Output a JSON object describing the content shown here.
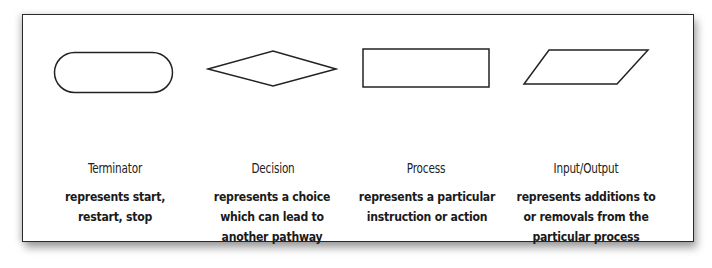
{
  "diagram": {
    "shapes": [
      {
        "id": "terminator",
        "shape": "rounded-rectangle",
        "title": "Terminator",
        "description_lines": [
          "represents start,",
          "restart, stop"
        ]
      },
      {
        "id": "decision",
        "shape": "diamond",
        "title": "Decision",
        "description_lines": [
          "represents a choice",
          "which can lead to",
          "another pathway"
        ]
      },
      {
        "id": "process",
        "shape": "rectangle",
        "title": "Process",
        "description_lines": [
          "represents a particular",
          "instruction or action"
        ]
      },
      {
        "id": "input-output",
        "shape": "parallelogram",
        "title": "Input/Output",
        "description_lines": [
          "represents additions to",
          "or removals from the",
          "particular process"
        ]
      }
    ],
    "colors": {
      "stroke": "#222222",
      "background": "#ffffff",
      "text": "#1a1a1a"
    }
  }
}
